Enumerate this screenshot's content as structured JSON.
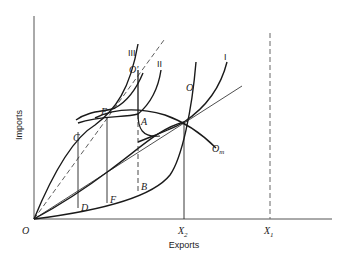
{
  "figure": {
    "xlabel": "Exports",
    "ylabel": "Imports",
    "origin_label": "O",
    "x_ticks": [
      {
        "label": "X",
        "sub": "2"
      },
      {
        "label": "X",
        "sub": "1"
      }
    ],
    "curve_labels": {
      "I": "I",
      "II": "II",
      "III": "III",
      "O": "O",
      "O_prime": "O'",
      "O_m": "O",
      "O_m_sub": "m"
    },
    "points": {
      "A": "A",
      "B": "B",
      "C": "C",
      "D": "D",
      "E": "E",
      "F": "F"
    }
  },
  "colors": {
    "ink": "#1a1a1a",
    "axis": "#555555",
    "dashed": "#666666"
  }
}
